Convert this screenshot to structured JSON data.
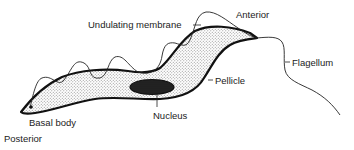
{
  "diagram": {
    "labels": {
      "undulating_membrane": "Undulating membrane",
      "anterior": "Anterior",
      "flagellum": "Flagellum",
      "pellicle": "Pellicle",
      "nucleus": "Nucleus",
      "basal_body": "Basal body",
      "posterior": "Posterior"
    },
    "colors": {
      "outline": "#111111",
      "stipple": "#9a9a9a",
      "nucleus_fill": "#2a2a2a",
      "text": "#222222"
    }
  }
}
